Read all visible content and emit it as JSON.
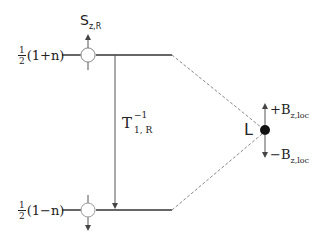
{
  "diagram": {
    "levels": {
      "upper": {
        "frac_num": "1",
        "frac_den": "2",
        "expr": "(1+n)"
      },
      "lower": {
        "frac_num": "1",
        "frac_den": "2",
        "expr": "(1−n)"
      }
    },
    "spin_label": {
      "main": "S",
      "sub": "z,R"
    },
    "transition_label": {
      "main": "T",
      "sup": "−1",
      "sub": "1, R"
    },
    "ligand_label": "L",
    "field_up": {
      "sign": "+B",
      "sub": "z,loc"
    },
    "field_down": {
      "sign": "−B",
      "sub": "z,loc"
    },
    "colors": {
      "line": "#333333",
      "dashed": "#888888",
      "dot": "#111111",
      "circle": "#888888"
    }
  }
}
